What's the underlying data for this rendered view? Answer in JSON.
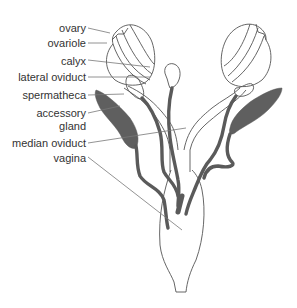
{
  "diagram": {
    "labels": {
      "ovary": "ovary",
      "ovariole": "ovariole",
      "calyx": "calyx",
      "lateral_oviduct": "lateral oviduct",
      "spermatheca": "spermatheca",
      "accessory_gland_line1": "accessory",
      "accessory_gland_line2": "gland",
      "median_oviduct": "median oviduct",
      "vagina": "vagina"
    },
    "colors": {
      "outline": "#555555",
      "gland_fill": "#5f5f5f",
      "leader": "#777777",
      "text": "#333333"
    }
  }
}
